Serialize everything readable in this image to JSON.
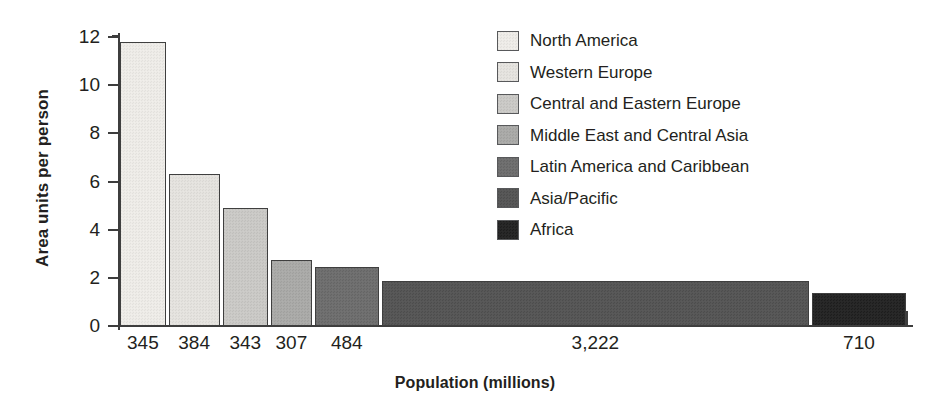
{
  "chart_data": {
    "type": "bar",
    "title": "",
    "subtitle": "",
    "xlabel": "Population (millions)",
    "ylabel": "Area units per person",
    "categories": [
      "345",
      "384",
      "343",
      "307",
      "484",
      "3,222",
      "710"
    ],
    "values": [
      11.8,
      6.3,
      4.9,
      2.75,
      2.45,
      1.85,
      1.35
    ],
    "series": [
      {
        "name": "Area units per person",
        "values": [
          11.8,
          6.3,
          4.9,
          2.75,
          2.45,
          1.85,
          1.35
        ]
      }
    ],
    "bar_widths_population": [
      345,
      384,
      343,
      307,
      484,
      3222,
      710
    ],
    "ylim": [
      0,
      12
    ],
    "yticks": [
      0,
      2,
      4,
      6,
      8,
      10,
      12
    ],
    "ytick_labels": [
      "0",
      "2",
      "4",
      "6",
      "8",
      "10",
      "12"
    ],
    "grid": false,
    "legend_position": "upper right",
    "legend": [
      "North America",
      "Western Europe",
      "Central and Eastern Europe",
      "Middle East and Central Asia",
      "Latin America and Caribbean",
      "Asia/Pacific",
      "Africa"
    ],
    "colors": [
      "#eceae6",
      "#e3e1dd",
      "#c9c8c5",
      "#a9a9a7",
      "#6e6e6e",
      "#565656",
      "#262626"
    ],
    "bar_outline_color": "#3f3f3f",
    "axis_color": "#3d3d3d",
    "text_color": "#231f20",
    "background_color": "#ffffff"
  },
  "axis": {
    "y_title": "Area units per person",
    "x_title": "Population (millions)"
  }
}
